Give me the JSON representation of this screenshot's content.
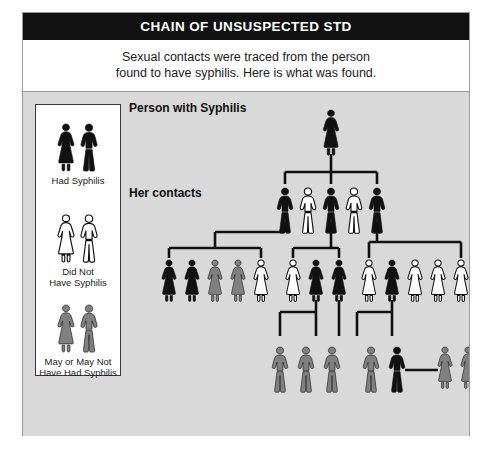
{
  "header": {
    "title": "CHAIN OF UNSUSPECTED STD"
  },
  "subtitle": {
    "line1": "Sexual contacts were traced from the person",
    "line2": "found to have syphilis. Here is what was found."
  },
  "colors": {
    "had_syphilis": "#111111",
    "did_not_have": "#ffffff",
    "may_or_may_not": "#808080",
    "outline": "#111111",
    "background": "#d9d9d9",
    "panel": "#ffffff",
    "header_bg": "#111111",
    "header_text": "#ffffff",
    "connector": "#111111",
    "frame_border": "#9a9a9a"
  },
  "legend": {
    "items": [
      {
        "key": "had-syphilis",
        "label_line1": "Had Syphilis",
        "label_line2": "",
        "fill": "#111111",
        "figures": [
          "female",
          "male"
        ]
      },
      {
        "key": "did-not-have-syphilis",
        "label_line1": "Did Not",
        "label_line2": "Have Syphilis",
        "fill": "#ffffff",
        "figures": [
          "female",
          "male"
        ]
      },
      {
        "key": "may-or-may-not-have-had-syphilis",
        "label_line1": "May or May Not",
        "label_line2": "Have Had Syphilis",
        "fill": "#808080",
        "figures": [
          "female",
          "male"
        ]
      }
    ]
  },
  "diagram": {
    "labels": {
      "root": "Person with Syphilis",
      "contacts": "Her contacts"
    },
    "generations": [
      {
        "name": "index-case",
        "row": 1,
        "y": 18,
        "figures": [
          {
            "sex": "female",
            "status": "had-syphilis",
            "x": 208,
            "scale": 1.0
          }
        ]
      },
      {
        "name": "her-contacts",
        "row": 2,
        "y": 96,
        "figures": [
          {
            "sex": "male",
            "status": "had-syphilis",
            "x": 162,
            "scale": 1.0
          },
          {
            "sex": "male",
            "status": "did-not-have-syphilis",
            "x": 185,
            "scale": 1.0
          },
          {
            "sex": "male",
            "status": "had-syphilis",
            "x": 208,
            "scale": 1.0
          },
          {
            "sex": "male",
            "status": "did-not-have-syphilis",
            "x": 231,
            "scale": 1.0
          },
          {
            "sex": "male",
            "status": "had-syphilis",
            "x": 254,
            "scale": 1.0
          }
        ]
      },
      {
        "name": "third-generation",
        "row": 3,
        "y": 168,
        "figures": [
          {
            "sex": "female",
            "status": "had-syphilis",
            "x": 46,
            "scale": 0.92
          },
          {
            "sex": "female",
            "status": "had-syphilis",
            "x": 69,
            "scale": 0.92
          },
          {
            "sex": "female",
            "status": "may-or-may-not-have-had-syphilis",
            "x": 92,
            "scale": 0.92
          },
          {
            "sex": "female",
            "status": "may-or-may-not-have-had-syphilis",
            "x": 115,
            "scale": 0.92
          },
          {
            "sex": "female",
            "status": "did-not-have-syphilis",
            "x": 138,
            "scale": 0.92
          },
          {
            "sex": "female",
            "status": "did-not-have-syphilis",
            "x": 170,
            "scale": 0.92
          },
          {
            "sex": "female",
            "status": "had-syphilis",
            "x": 193,
            "scale": 0.92
          },
          {
            "sex": "female",
            "status": "had-syphilis",
            "x": 216,
            "scale": 0.92
          },
          {
            "sex": "female",
            "status": "did-not-have-syphilis",
            "x": 246,
            "scale": 0.92
          },
          {
            "sex": "female",
            "status": "had-syphilis",
            "x": 269,
            "scale": 0.92
          },
          {
            "sex": "female",
            "status": "did-not-have-syphilis",
            "x": 292,
            "scale": 0.92
          },
          {
            "sex": "female",
            "status": "did-not-have-syphilis",
            "x": 315,
            "scale": 0.92
          },
          {
            "sex": "female",
            "status": "did-not-have-syphilis",
            "x": 338,
            "scale": 0.92
          }
        ]
      },
      {
        "name": "fourth-generation",
        "row": 4,
        "y": 255,
        "figures": [
          {
            "sex": "male",
            "status": "may-or-may-not-have-had-syphilis",
            "x": 157,
            "scale": 1.0
          },
          {
            "sex": "male",
            "status": "may-or-may-not-have-had-syphilis",
            "x": 183,
            "scale": 1.0
          },
          {
            "sex": "male",
            "status": "may-or-may-not-have-had-syphilis",
            "x": 209,
            "scale": 1.0
          },
          {
            "sex": "male",
            "status": "may-or-may-not-have-had-syphilis",
            "x": 248,
            "scale": 1.0
          },
          {
            "sex": "male",
            "status": "had-syphilis",
            "x": 274,
            "scale": 1.0
          },
          {
            "sex": "female",
            "status": "may-or-may-not-have-had-syphilis",
            "x": 322,
            "scale": 0.92
          },
          {
            "sex": "female",
            "status": "may-or-may-not-have-had-syphilis",
            "x": 345,
            "scale": 0.92
          }
        ]
      }
    ],
    "connectors": [
      {
        "key": "root-stem",
        "type": "v",
        "x": 208,
        "y1": 62,
        "y2": 80
      },
      {
        "key": "contacts-bar",
        "type": "h",
        "y": 80,
        "x1": 162,
        "x2": 254
      },
      {
        "key": "contact-1-drop",
        "type": "v",
        "x": 162,
        "y1": 80,
        "y2": 92
      },
      {
        "key": "contact-3-drop",
        "type": "v",
        "x": 208,
        "y1": 80,
        "y2": 92
      },
      {
        "key": "contact-5-drop",
        "type": "v",
        "x": 254,
        "y1": 80,
        "y2": 92
      },
      {
        "key": "g1-stem-down",
        "type": "v",
        "x": 162,
        "y1": 130,
        "y2": 140
      },
      {
        "key": "g1-stem-left",
        "type": "h",
        "y": 140,
        "x1": 92,
        "x2": 162
      },
      {
        "key": "g1-riser",
        "type": "v",
        "x": 92,
        "y1": 140,
        "y2": 156
      },
      {
        "key": "g1-bar",
        "type": "h",
        "y": 156,
        "x1": 46,
        "x2": 138
      },
      {
        "key": "g1-drop-left",
        "type": "v",
        "x": 46,
        "y1": 156,
        "y2": 166
      },
      {
        "key": "g1-drop-right",
        "type": "v",
        "x": 138,
        "y1": 156,
        "y2": 166
      },
      {
        "key": "g2-stem",
        "type": "v",
        "x": 208,
        "y1": 130,
        "y2": 156
      },
      {
        "key": "g2-bar",
        "type": "h",
        "y": 156,
        "x1": 170,
        "x2": 216
      },
      {
        "key": "g2-drop-left",
        "type": "v",
        "x": 170,
        "y1": 156,
        "y2": 166
      },
      {
        "key": "g2-drop-right",
        "type": "v",
        "x": 216,
        "y1": 156,
        "y2": 166
      },
      {
        "key": "g3-stem",
        "type": "v",
        "x": 254,
        "y1": 130,
        "y2": 150
      },
      {
        "key": "g3-bar",
        "type": "h",
        "y": 150,
        "x1": 246,
        "x2": 338
      },
      {
        "key": "g3-drop-left",
        "type": "v",
        "x": 246,
        "y1": 150,
        "y2": 166
      },
      {
        "key": "g3-drop-right",
        "type": "v",
        "x": 338,
        "y1": 150,
        "y2": 166
      },
      {
        "key": "g4a-stem",
        "type": "v",
        "x": 193,
        "y1": 208,
        "y2": 220
      },
      {
        "key": "g4a-bar",
        "type": "h",
        "y": 220,
        "x1": 157,
        "x2": 193
      },
      {
        "key": "g4a-drop",
        "type": "v",
        "x": 157,
        "y1": 220,
        "y2": 244
      },
      {
        "key": "g4a-drop2",
        "type": "v",
        "x": 193,
        "y1": 220,
        "y2": 244
      },
      {
        "key": "g4b-stem",
        "type": "v",
        "x": 216,
        "y1": 208,
        "y2": 244
      },
      {
        "key": "g4c-stem",
        "type": "v",
        "x": 269,
        "y1": 208,
        "y2": 220
      },
      {
        "key": "g4c-bar",
        "type": "h",
        "y": 220,
        "x1": 234,
        "x2": 269
      },
      {
        "key": "g4c-drop",
        "type": "v",
        "x": 234,
        "y1": 220,
        "y2": 244
      },
      {
        "key": "g4c-drop2",
        "type": "v",
        "x": 269,
        "y1": 220,
        "y2": 244
      },
      {
        "key": "union-line",
        "type": "h",
        "y": 278,
        "x1": 282,
        "x2": 315
      }
    ]
  }
}
